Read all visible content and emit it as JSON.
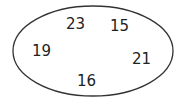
{
  "diagram": {
    "shape": "ellipse",
    "stroke_color": "#333333",
    "numbers": [
      {
        "value": "23",
        "x": 66,
        "y": 17
      },
      {
        "value": "15",
        "x": 110,
        "y": 19
      },
      {
        "value": "19",
        "x": 32,
        "y": 44
      },
      {
        "value": "21",
        "x": 132,
        "y": 52
      },
      {
        "value": "16",
        "x": 77,
        "y": 74
      }
    ]
  }
}
